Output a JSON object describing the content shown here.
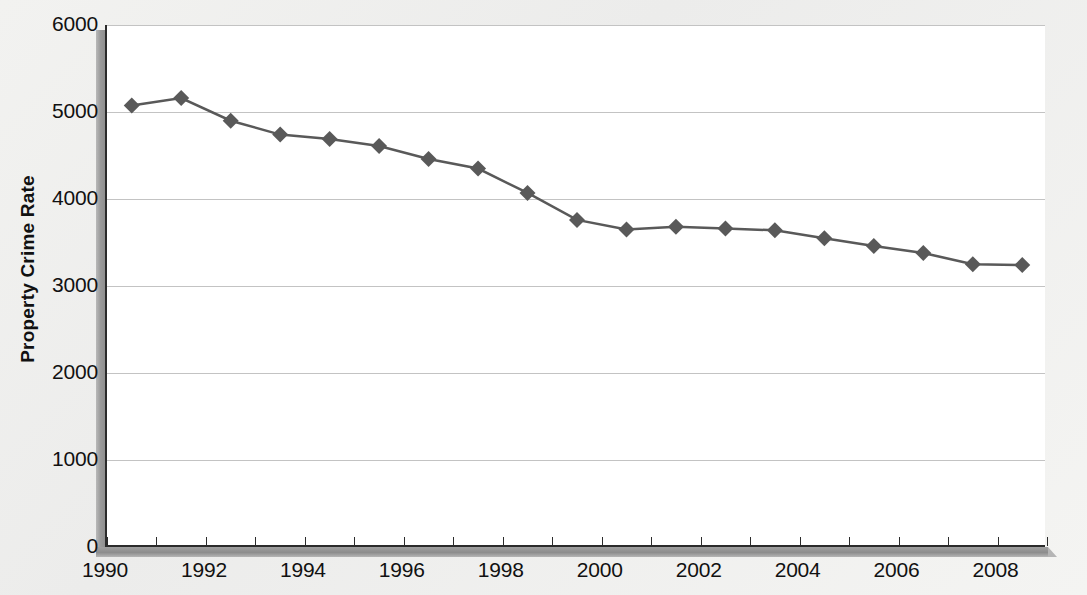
{
  "chart_data": {
    "type": "line",
    "title": "",
    "xlabel": "",
    "ylabel": "Property Crime Rate",
    "x": [
      1990,
      1991,
      1992,
      1993,
      1994,
      1995,
      1996,
      1997,
      1998,
      1999,
      2000,
      2001,
      2002,
      2003,
      2004,
      2005,
      2006,
      2007,
      2008
    ],
    "values": [
      5075,
      5160,
      4900,
      4740,
      4690,
      4610,
      4460,
      4350,
      4070,
      3760,
      3650,
      3680,
      3660,
      3640,
      3550,
      3460,
      3380,
      3250,
      3240
    ],
    "series": [
      {
        "name": "Property Crime Rate",
        "values": [
          5075,
          5160,
          4900,
          4740,
          4690,
          4610,
          4460,
          4350,
          4070,
          3760,
          3650,
          3680,
          3660,
          3640,
          3550,
          3460,
          3380,
          3250,
          3240
        ]
      }
    ],
    "ylim": [
      0,
      6000
    ],
    "xlim": [
      1990,
      2009
    ],
    "ytick_values": [
      0,
      1000,
      2000,
      3000,
      4000,
      5000,
      6000
    ],
    "ytick_labels": [
      "0",
      "1000",
      "2000",
      "3000",
      "4000",
      "5000",
      "6000"
    ],
    "xtick_values": [
      1990,
      1991,
      1992,
      1993,
      1994,
      1995,
      1996,
      1997,
      1998,
      1999,
      2000,
      2001,
      2002,
      2003,
      2004,
      2005,
      2006,
      2007,
      2008,
      2009
    ],
    "xtick_labels_shown": [
      {
        "value": 1990,
        "label": "1990"
      },
      {
        "value": 1992,
        "label": "1992"
      },
      {
        "value": 1994,
        "label": "1994"
      },
      {
        "value": 1996,
        "label": "1996"
      },
      {
        "value": 1998,
        "label": "1998"
      },
      {
        "value": 2000,
        "label": "2000"
      },
      {
        "value": 2002,
        "label": "2002"
      },
      {
        "value": 2004,
        "label": "2004"
      },
      {
        "value": 2006,
        "label": "2006"
      },
      {
        "value": 2008,
        "label": "2008"
      }
    ],
    "grid": {
      "horizontal": true,
      "vertical": false
    },
    "legend": {
      "visible": false,
      "position": "none"
    },
    "marker": {
      "shape": "diamond",
      "color": "#595959",
      "size": 16
    },
    "line": {
      "color": "#595959",
      "width": 2.5
    },
    "colors": {
      "series": "#595959",
      "gridline": "#c3c3c3",
      "axis": "#2b2b2b",
      "plot_background": "#ffffff",
      "page_background": "#f1f1ef"
    }
  }
}
